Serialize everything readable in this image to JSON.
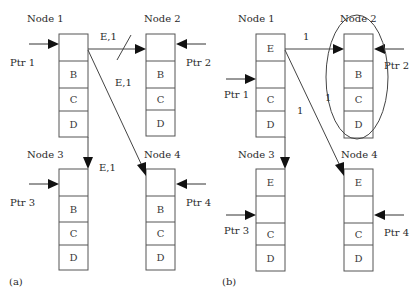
{
  "diagram": {
    "panels": [
      {
        "id": "a",
        "caption": "(a)",
        "nodes": [
          {
            "title": "Node 1",
            "pointer": "Ptr 1",
            "cells": [
              "",
              "B",
              "C",
              "D"
            ]
          },
          {
            "title": "Node 2",
            "pointer": "Ptr 2",
            "cells": [
              "",
              "B",
              "C",
              "D"
            ]
          },
          {
            "title": "Node 3",
            "pointer": "Ptr 3",
            "cells": [
              "",
              "B",
              "C",
              "D"
            ]
          },
          {
            "title": "Node 4",
            "pointer": "Ptr 4",
            "cells": [
              "",
              "B",
              "C",
              "D"
            ]
          }
        ],
        "edges": [
          {
            "from": "Node 1",
            "to": "Node 2",
            "label": "E,1",
            "blocked": true
          },
          {
            "from": "Node 1",
            "to": "Node 4",
            "label": "E,1"
          },
          {
            "from": "Node 1",
            "to": "Node 3",
            "label": "E,1"
          }
        ]
      },
      {
        "id": "b",
        "caption": "(b)",
        "nodes": [
          {
            "title": "Node 1",
            "pointer": "Ptr 1",
            "cells": [
              "E",
              "",
              "C",
              "D"
            ]
          },
          {
            "title": "Node 2",
            "pointer": "Ptr 2",
            "cells": [
              "",
              "B",
              "C",
              "D"
            ],
            "highlighted": true
          },
          {
            "title": "Node 3",
            "pointer": "Ptr 3",
            "cells": [
              "E",
              "",
              "C",
              "D"
            ]
          },
          {
            "title": "Node 4",
            "pointer": "Ptr 4",
            "cells": [
              "E",
              "",
              "C",
              "D"
            ]
          }
        ],
        "edges": [
          {
            "from": "Node 1",
            "to": "Node 2",
            "label": "1"
          },
          {
            "from": "Node 1",
            "to": "Node 4",
            "label": "1"
          },
          {
            "from": "Node 1",
            "to": "Node 3",
            "label": ""
          }
        ],
        "annotations": [
          {
            "label": "1",
            "near": "Node 2 ellipse"
          }
        ]
      }
    ]
  }
}
